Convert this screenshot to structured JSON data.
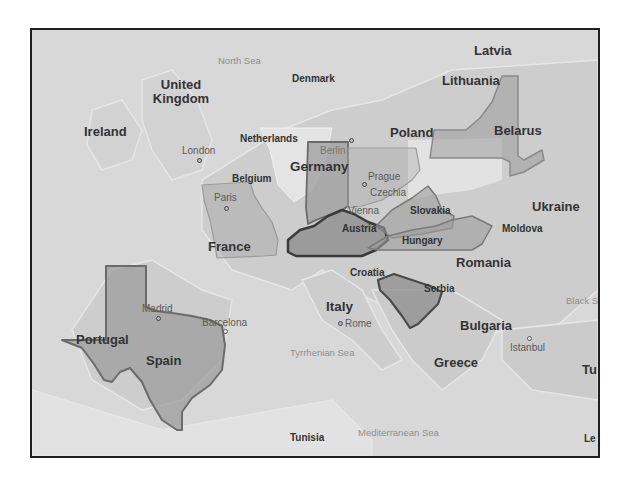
{
  "map": {
    "colors": {
      "land": "#d3d3d3",
      "sea": "#d9d9d9",
      "overlay_fill": "#9a9a9a",
      "overlay_stroke": "#6e6e6e",
      "frame_border": "#1f1f1f"
    },
    "countries": [
      {
        "name": "Latvia"
      },
      {
        "name": "Lithuania"
      },
      {
        "name": "United Kingdom"
      },
      {
        "name": "Denmark"
      },
      {
        "name": "Ireland"
      },
      {
        "name": "Netherlands"
      },
      {
        "name": "Poland"
      },
      {
        "name": "Belarus"
      },
      {
        "name": "Germany"
      },
      {
        "name": "Belgium"
      },
      {
        "name": "Czechia"
      },
      {
        "name": "Slovakia"
      },
      {
        "name": "Ukraine"
      },
      {
        "name": "Austria"
      },
      {
        "name": "Hungary"
      },
      {
        "name": "Moldova"
      },
      {
        "name": "France"
      },
      {
        "name": "Romania"
      },
      {
        "name": "Croatia"
      },
      {
        "name": "Serbia"
      },
      {
        "name": "Italy"
      },
      {
        "name": "Portugal"
      },
      {
        "name": "Spain"
      },
      {
        "name": "Bulgaria"
      },
      {
        "name": "Greece"
      },
      {
        "name": "Tunisia"
      },
      {
        "name": "Tu"
      },
      {
        "name": "Le"
      }
    ],
    "cities": [
      {
        "name": "London"
      },
      {
        "name": "Berlin"
      },
      {
        "name": "Prague"
      },
      {
        "name": "Paris"
      },
      {
        "name": "Vienna"
      },
      {
        "name": "Madrid"
      },
      {
        "name": "Barcelona"
      },
      {
        "name": "Rome"
      },
      {
        "name": "Istanbul"
      }
    ],
    "seas": [
      {
        "name": "North Sea"
      },
      {
        "name": "Tyrrhenian Sea"
      },
      {
        "name": "Mediterranean Sea"
      },
      {
        "name": "Black S"
      }
    ],
    "overlays": [
      {
        "shape": "Texas"
      },
      {
        "shape": "Missouri"
      },
      {
        "shape": "Indiana"
      },
      {
        "shape": "Kentucky"
      },
      {
        "shape": "Pennsylvania"
      },
      {
        "shape": "West Virginia"
      },
      {
        "shape": "Virginia"
      },
      {
        "shape": "New York"
      },
      {
        "shape": "South Carolina"
      }
    ]
  }
}
